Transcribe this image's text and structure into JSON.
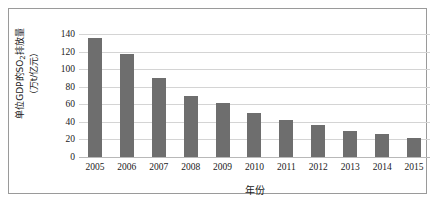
{
  "chart_data": {
    "type": "bar",
    "title": "",
    "categories": [
      "2005",
      "2006",
      "2007",
      "2008",
      "2009",
      "2010",
      "2011",
      "2012",
      "2013",
      "2014",
      "2015"
    ],
    "values": [
      136,
      117,
      90,
      70,
      61,
      50,
      42,
      36,
      30,
      26,
      22
    ],
    "series": [
      {
        "name": "单位GDP的SO2排放量",
        "values": [
          136,
          117,
          90,
          70,
          61,
          50,
          42,
          36,
          30,
          26,
          22
        ]
      }
    ],
    "xlabel": "年份",
    "ylabel_line1": "单位GDP的SO",
    "ylabel_sub": "2",
    "ylabel_line1_tail": "排放量",
    "ylabel_line2": "（万t/亿元）",
    "ylim": [
      0,
      140
    ],
    "yticks": [
      140,
      120,
      100,
      80,
      60,
      40,
      20,
      0
    ],
    "ytick_labels": [
      "140",
      "120",
      "100",
      "80",
      "60",
      "40",
      "20",
      "0"
    ],
    "grid": true,
    "legend": "none",
    "bar_color": "#6e6e6e",
    "gridline_color": "#d4d4d4",
    "axis_color": "#b8b8b8",
    "frame_color": "#9a9a9a",
    "background_color": "#ffffff"
  }
}
